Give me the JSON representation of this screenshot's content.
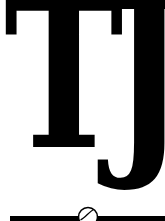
{
  "logo": {
    "monogram": {
      "letter_1": "T",
      "letter_2": "J"
    },
    "ornament": {
      "rule_color": "#000000",
      "icon": "baseball-icon"
    },
    "colors": {
      "ink": "#000000",
      "background": "#ffffff"
    }
  }
}
